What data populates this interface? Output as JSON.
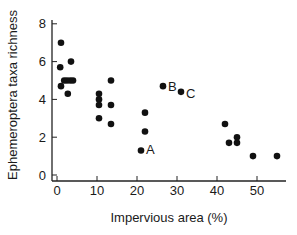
{
  "chart_data": {
    "type": "scatter",
    "title": "",
    "xlabel": "Impervious area (%)",
    "ylabel": "Ephemeroptera taxa richness",
    "xlim": [
      -1,
      57
    ],
    "ylim": [
      -0.3,
      8.2
    ],
    "xticks": [
      0,
      10,
      20,
      30,
      40,
      50
    ],
    "yticks": [
      0,
      2,
      4,
      6,
      8
    ],
    "grid": false,
    "legend": null,
    "series": [
      {
        "name": "sites",
        "marker": "filled-circle",
        "color": "#111111",
        "points": [
          {
            "x": 1.0,
            "y": 7.0
          },
          {
            "x": 3.5,
            "y": 6.0
          },
          {
            "x": 0.8,
            "y": 5.7
          },
          {
            "x": 1.8,
            "y": 5.0
          },
          {
            "x": 2.5,
            "y": 5.0
          },
          {
            "x": 3.3,
            "y": 5.0
          },
          {
            "x": 4.0,
            "y": 5.0
          },
          {
            "x": 1.0,
            "y": 4.7
          },
          {
            "x": 2.7,
            "y": 4.3
          },
          {
            "x": 10.5,
            "y": 4.3
          },
          {
            "x": 10.5,
            "y": 4.0
          },
          {
            "x": 10.5,
            "y": 3.7
          },
          {
            "x": 10.5,
            "y": 3.0
          },
          {
            "x": 13.5,
            "y": 5.0
          },
          {
            "x": 13.5,
            "y": 3.7
          },
          {
            "x": 13.5,
            "y": 2.7
          },
          {
            "x": 22.0,
            "y": 3.3
          },
          {
            "x": 22.0,
            "y": 2.3
          },
          {
            "x": 21.0,
            "y": 1.3,
            "label": "A"
          },
          {
            "x": 26.5,
            "y": 4.7,
            "label": "B"
          },
          {
            "x": 31.0,
            "y": 4.4,
            "label": "C"
          },
          {
            "x": 42.0,
            "y": 2.7
          },
          {
            "x": 43.0,
            "y": 1.7
          },
          {
            "x": 45.0,
            "y": 2.0
          },
          {
            "x": 45.0,
            "y": 1.7
          },
          {
            "x": 49.0,
            "y": 1.0
          },
          {
            "x": 55.0,
            "y": 1.0
          }
        ]
      }
    ],
    "annotations": [
      "A",
      "B",
      "C"
    ]
  }
}
